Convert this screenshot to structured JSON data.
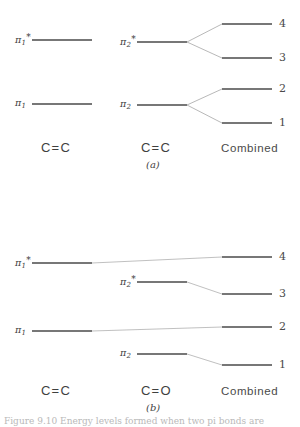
{
  "figure": {
    "background": "#ffffff",
    "line_color": "#4a4a4a",
    "connector_color": "#9a9a9a",
    "caption": "Figure 9.10   Energy levels formed when two pi bonds are"
  },
  "panel_a": {
    "caption": "(a)",
    "column_labels": {
      "left": "C=C",
      "middle": "C=C",
      "right": "Combined"
    },
    "left_levels": [
      {
        "label_pi": "π",
        "label_sub": "1",
        "label_star": "*",
        "name": "pi-1-star",
        "y": 40
      },
      {
        "label_pi": "π",
        "label_sub": "1",
        "label_star": "",
        "name": "pi-1",
        "y": 104
      }
    ],
    "middle_levels": [
      {
        "label_pi": "π",
        "label_sub": "2",
        "label_star": "*",
        "name": "pi-2-star",
        "y": 42
      },
      {
        "label_pi": "π",
        "label_sub": "2",
        "label_star": "",
        "name": "pi-2",
        "y": 105
      }
    ],
    "combined_levels": [
      {
        "number": "4",
        "name": "level-4",
        "y": 24
      },
      {
        "number": "3",
        "name": "level-3",
        "y": 58
      },
      {
        "number": "2",
        "name": "level-2",
        "y": 89
      },
      {
        "number": "1",
        "name": "level-1",
        "y": 123
      }
    ]
  },
  "panel_b": {
    "caption": "(b)",
    "column_labels": {
      "left": "C=C",
      "middle": "C=O",
      "right": "Combined"
    },
    "left_levels": [
      {
        "label_pi": "π",
        "label_sub": "1",
        "label_star": "*",
        "name": "pi-1-star",
        "y": 51
      },
      {
        "label_pi": "π",
        "label_sub": "1",
        "label_star": "",
        "name": "pi-1",
        "y": 119
      }
    ],
    "middle_levels": [
      {
        "label_pi": "π",
        "label_sub": "2",
        "label_star": "*",
        "name": "pi-2-star",
        "y": 70
      },
      {
        "label_pi": "π",
        "label_sub": "2",
        "label_star": "",
        "name": "pi-2",
        "y": 142
      }
    ],
    "combined_levels": [
      {
        "number": "4",
        "name": "level-4",
        "y": 45
      },
      {
        "number": "3",
        "name": "level-3",
        "y": 82
      },
      {
        "number": "2",
        "name": "level-2",
        "y": 115
      },
      {
        "number": "1",
        "name": "level-1",
        "y": 153
      }
    ]
  }
}
